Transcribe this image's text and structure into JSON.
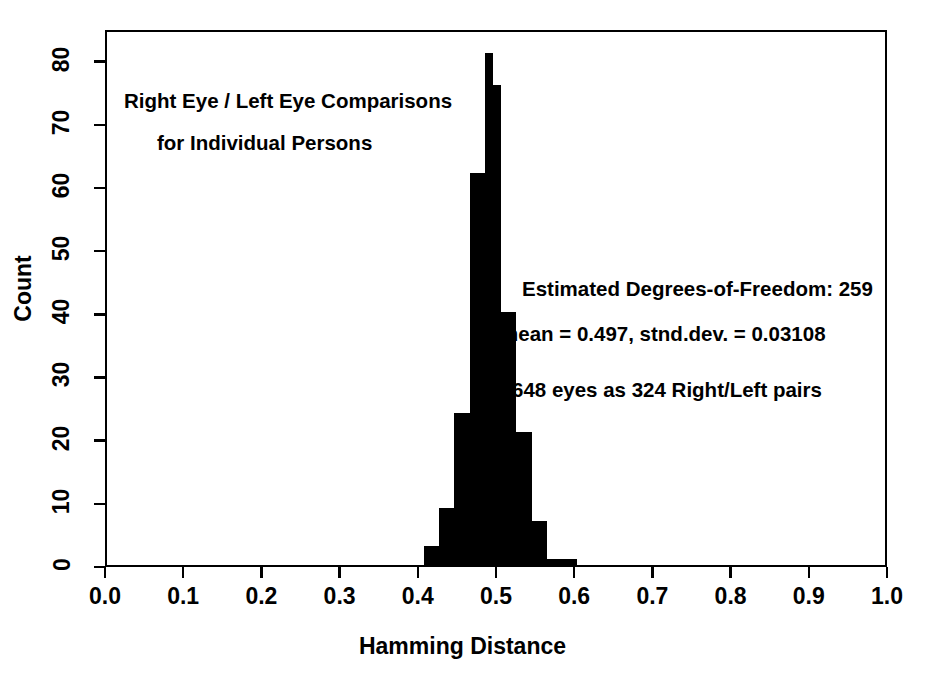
{
  "chart_data": {
    "type": "bar",
    "title": "",
    "xlabel": "Hamming Distance",
    "ylabel": "Count",
    "xlim": [
      0.0,
      1.0
    ],
    "ylim": [
      0,
      85
    ],
    "grid": false,
    "legend": null,
    "bin_width": 0.0098,
    "bar_color": "#000000",
    "xticks": [
      "0.0",
      "0.1",
      "0.2",
      "0.3",
      "0.4",
      "0.5",
      "0.6",
      "0.7",
      "0.8",
      "0.9",
      "1.0"
    ],
    "xtick_values": [
      0.0,
      0.1,
      0.2,
      0.3,
      0.4,
      0.5,
      0.6,
      0.7,
      0.8,
      0.9,
      1.0
    ],
    "yticks": [
      "0",
      "10",
      "20",
      "30",
      "40",
      "50",
      "60",
      "70",
      "80"
    ],
    "ytick_values": [
      0,
      10,
      20,
      30,
      40,
      50,
      60,
      70,
      80
    ],
    "x": [
      0.4098,
      0.4196,
      0.4294,
      0.4392,
      0.449,
      0.4588,
      0.4686,
      0.4784,
      0.4882,
      0.498,
      0.5078,
      0.5176,
      0.5274,
      0.5372,
      0.547,
      0.5568,
      0.5666,
      0.5764,
      0.5862,
      0.596
    ],
    "categories": [
      "0.41",
      "0.42",
      "0.43",
      "0.44",
      "0.45",
      "0.46",
      "0.47",
      "0.48",
      "0.49",
      "0.50",
      "0.51",
      "0.52",
      "0.53",
      "0.54",
      "0.55",
      "0.56",
      "0.57",
      "0.58",
      "0.59",
      "0.60"
    ],
    "values": [
      3,
      3,
      9,
      9,
      24,
      24,
      62,
      62,
      81,
      76,
      40,
      40,
      21,
      21,
      7,
      7,
      1,
      1,
      1,
      1
    ],
    "annotations": [
      "Right Eye / Left Eye Comparisons",
      "for Individual Persons",
      "Estimated Degrees-of-Freedom: 259",
      "mean = 0.497,  stnd.dev. = 0.03108",
      "648 eyes as 324 Right/Left pairs"
    ]
  },
  "plot": {
    "title_line_1": "Right Eye / Left Eye Comparisons",
    "title_line_2": "for Individual Persons",
    "stat_line_1": "Estimated Degrees-of-Freedom: 259",
    "stat_line_2": "mean = 0.497,  stnd.dev. = 0.03108",
    "stat_line_3": "648 eyes as 324 Right/Left pairs",
    "x_axis_title": "Hamming Distance",
    "y_axis_title": "Count"
  }
}
